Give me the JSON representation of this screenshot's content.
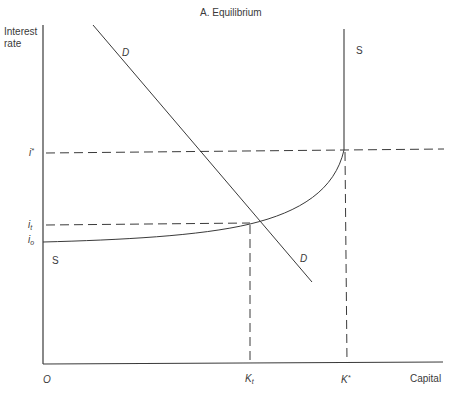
{
  "title": "A. Equilibrium",
  "axes": {
    "y_label_line1": "Interest",
    "y_label_line2": "rate",
    "x_label": "Capital",
    "origin": "O"
  },
  "y_ticks": {
    "i_star": "i",
    "i_star_sup": "*",
    "i_t": "i",
    "i_t_sub": "t",
    "i_0": "i",
    "i_0_sub": "o"
  },
  "x_ticks": {
    "k_t": "K",
    "k_t_sub": "t",
    "k_star": "K",
    "k_star_sup": "*"
  },
  "curves": {
    "demand_top_label": "D",
    "demand_bottom_label": "D",
    "supply_top_label": "S",
    "supply_bottom_label": "S"
  },
  "colors": {
    "line": "#3a3a3a",
    "background": "#ffffff"
  }
}
